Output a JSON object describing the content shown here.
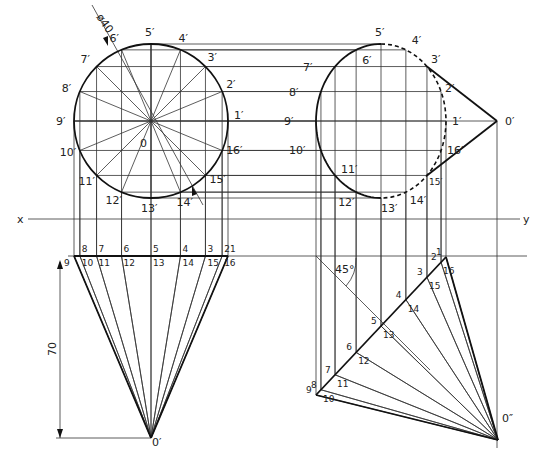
{
  "diagram": {
    "type": "orthographic projection of a cone (axis inclined 45°)",
    "reference_line": {
      "left_label": "x",
      "right_label": "y"
    },
    "top_view_left": {
      "center_label": "0",
      "diameter_dimension": "ø40",
      "point_labels": [
        "1′",
        "2′",
        "3′",
        "4′",
        "5′",
        "6′",
        "7′",
        "8′",
        "9′",
        "10′",
        "11′",
        "12′",
        "13′",
        "14′",
        "15′",
        "16′"
      ]
    },
    "front_view_left": {
      "base_labels_top": [
        "9",
        "8",
        "7",
        "6",
        "5",
        "4",
        "3",
        "2",
        "1"
      ],
      "base_labels_bottom": [
        "10",
        "11",
        "12",
        "13",
        "14",
        "15",
        "16"
      ],
      "apex_label": "0′",
      "height_dimension": "70"
    },
    "side_view_right_top": {
      "apex_label": "0′",
      "point_labels": [
        "1′",
        "2′",
        "3′",
        "4′",
        "5′",
        "6′",
        "7′",
        "8′",
        "9′",
        "10′",
        "11′",
        "12′",
        "13′",
        "14′",
        "15′",
        "16′"
      ]
    },
    "front_view_right_bottom": {
      "angle_label": "45°",
      "apex_label": "0″",
      "base_labels_top": [
        "9",
        "8",
        "7",
        "6",
        "5",
        "4",
        "3",
        "2",
        "1"
      ],
      "base_labels_bottom": [
        "10",
        "11",
        "12",
        "13",
        "14",
        "15",
        "16"
      ]
    }
  }
}
